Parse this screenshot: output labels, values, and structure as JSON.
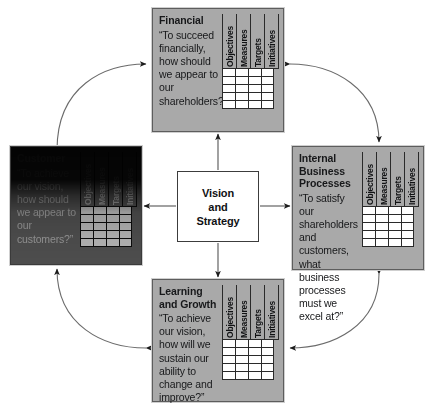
{
  "diagram": {
    "name": "Balanced Scorecard Framework",
    "type": "balanced-scorecard",
    "center": {
      "lines": [
        "Vision",
        "and",
        "Strategy"
      ]
    },
    "table_columns": [
      "Objectives",
      "Measures",
      "Targets",
      "Initiatives"
    ],
    "table_rows": 5,
    "perspectives": [
      {
        "id": "financial",
        "title": "Financial",
        "question": "“To succeed financially, how should we appear to our shareholders?”",
        "position": "top",
        "fill": "#a9a9a9"
      },
      {
        "id": "customer",
        "title": "Customer",
        "question": "“To achieve our vision, how should we appear to our customers?”",
        "position": "left",
        "fill": "#6e6e6e"
      },
      {
        "id": "internal",
        "title": "Internal Business Processes",
        "question": "“To satisfy our shareholders and customers, what business processes must we excel at?”",
        "position": "right",
        "fill": "#a9a9a9"
      },
      {
        "id": "learning",
        "title": "Learning and Growth",
        "question": "“To achieve our vision, how will we sustain our ability to change and improve?”",
        "position": "bottom",
        "fill": "#a9a9a9"
      }
    ],
    "connectors": {
      "radial": [
        {
          "from": "vision",
          "to": "financial",
          "style": "straight-arrow"
        },
        {
          "from": "vision",
          "to": "customer",
          "style": "straight-arrow"
        },
        {
          "from": "vision",
          "to": "internal",
          "style": "straight-arrow"
        },
        {
          "from": "vision",
          "to": "learning",
          "style": "straight-arrow"
        }
      ],
      "curved": [
        {
          "between": [
            "customer",
            "financial"
          ],
          "style": "double-headed-curve"
        },
        {
          "between": [
            "financial",
            "internal"
          ],
          "style": "double-headed-curve"
        },
        {
          "between": [
            "internal",
            "learning"
          ],
          "style": "double-headed-curve"
        },
        {
          "between": [
            "learning",
            "customer"
          ],
          "style": "double-headed-curve"
        }
      ]
    }
  }
}
